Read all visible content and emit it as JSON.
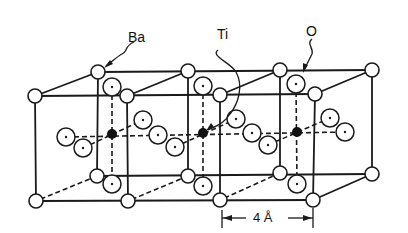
{
  "diagram": {
    "title": "",
    "labels": {
      "ba": "Ba",
      "ti": "Ti",
      "o": "O",
      "dimension": "4 Å"
    },
    "colors": {
      "line": "#1a1a1a",
      "background": "#ffffff",
      "ti_fill": "#111111",
      "ion_fill": "#ffffff"
    },
    "legend": [
      {
        "symbol": "open-circle",
        "species": "Ba"
      },
      {
        "symbol": "filled-circle",
        "species": "Ti"
      },
      {
        "symbol": "dotted-circle",
        "species": "O"
      }
    ],
    "unit_cells": 3,
    "lattice_constant": "4 Å"
  }
}
